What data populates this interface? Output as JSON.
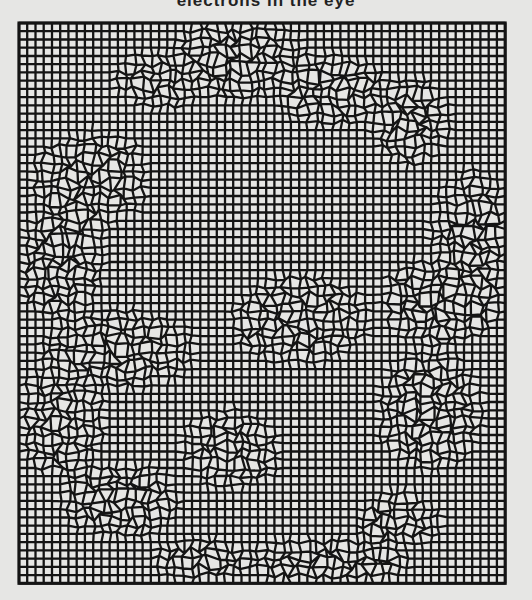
{
  "caption": "electrons in the eye",
  "figure": {
    "type": "lattice-simulation",
    "background": "#e6e6e4",
    "line_color": "#141414",
    "origin": [
      19,
      23
    ],
    "cell": 8.24,
    "cols": 59,
    "rows": 68,
    "line_width": 2.3,
    "disordered_regions": [
      {
        "cx": 160,
        "cy": 80,
        "rx": 45,
        "ry": 30
      },
      {
        "cx": 240,
        "cy": 60,
        "rx": 70,
        "ry": 40
      },
      {
        "cx": 330,
        "cy": 90,
        "rx": 60,
        "ry": 35
      },
      {
        "cx": 410,
        "cy": 120,
        "rx": 40,
        "ry": 45
      },
      {
        "cx": 90,
        "cy": 180,
        "rx": 60,
        "ry": 50
      },
      {
        "cx": 60,
        "cy": 260,
        "rx": 45,
        "ry": 60
      },
      {
        "cx": 470,
        "cy": 230,
        "rx": 40,
        "ry": 60
      },
      {
        "cx": 440,
        "cy": 300,
        "rx": 60,
        "ry": 45
      },
      {
        "cx": 300,
        "cy": 320,
        "rx": 70,
        "ry": 45
      },
      {
        "cx": 120,
        "cy": 350,
        "rx": 80,
        "ry": 40
      },
      {
        "cx": 60,
        "cy": 420,
        "rx": 45,
        "ry": 55
      },
      {
        "cx": 430,
        "cy": 410,
        "rx": 55,
        "ry": 60
      },
      {
        "cx": 230,
        "cy": 450,
        "rx": 50,
        "ry": 40
      },
      {
        "cx": 120,
        "cy": 500,
        "rx": 60,
        "ry": 40
      },
      {
        "cx": 330,
        "cy": 560,
        "rx": 80,
        "ry": 25
      },
      {
        "cx": 200,
        "cy": 560,
        "rx": 50,
        "ry": 20
      },
      {
        "cx": 400,
        "cy": 520,
        "rx": 40,
        "ry": 30
      }
    ]
  }
}
